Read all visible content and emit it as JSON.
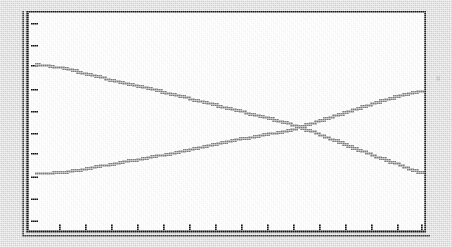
{
  "figure": {
    "kind": "scanned-line-chart",
    "background_color": "#d9d9d9",
    "plot_background_color": "#ffffff",
    "frame_color": "#111111",
    "series_color": "#808080",
    "title": "",
    "subtitle": "",
    "caption": ""
  },
  "chart_data": {
    "type": "line",
    "title": "",
    "xlabel": "",
    "ylabel": "",
    "grid": false,
    "legend": false,
    "legend_position": "none",
    "xlim": [
      0,
      14
    ],
    "ylim": [
      0,
      8
    ],
    "x_tick_labels": [
      "",
      "",
      "",
      "",
      "",
      "",
      "",
      "",
      "",
      "",
      "",
      "",
      "",
      "",
      ""
    ],
    "y_tick_labels": [
      "",
      "",
      "",
      "",
      "",
      "",
      "",
      "",
      ""
    ],
    "x_tick_count": 15,
    "y_tick_count": 9,
    "x": [
      0,
      1,
      2,
      3,
      4,
      5,
      6,
      7,
      8,
      9,
      10,
      11,
      12,
      13,
      14
    ],
    "series": [
      {
        "name": "descending-series",
        "color": "#808080",
        "values": [
          6.3,
          6.1,
          5.85,
          5.6,
          5.35,
          5.1,
          4.85,
          4.6,
          4.3,
          4.05,
          3.75,
          3.45,
          3.15,
          2.85,
          2.5
        ]
      },
      {
        "name": "ascending-series",
        "color": "#808080",
        "values": [
          2.55,
          2.7,
          2.9,
          3.1,
          3.3,
          3.5,
          3.7,
          3.9,
          4.15,
          4.4,
          4.65,
          4.9,
          5.15,
          5.4,
          5.6
        ]
      }
    ],
    "intersection": {
      "x": 8.05,
      "y": 4.2
    }
  },
  "geometry": {
    "frame": {
      "left": 26,
      "top": 11,
      "width": 400,
      "height": 222
    },
    "inner": {
      "left": 30,
      "top": 15,
      "right": 423,
      "bottom": 229
    },
    "series_pixels": {
      "descending": [
        [
          32,
          62
        ],
        [
          60,
          66
        ],
        [
          88,
          73
        ],
        [
          116,
          80
        ],
        [
          144,
          86
        ],
        [
          172,
          93
        ],
        [
          200,
          100
        ],
        [
          228,
          107
        ],
        [
          256,
          114
        ],
        [
          284,
          121
        ],
        [
          312,
          131
        ],
        [
          340,
          142
        ],
        [
          368,
          153
        ],
        [
          396,
          163
        ],
        [
          419,
          172
        ]
      ],
      "ascending": [
        [
          32,
          171
        ],
        [
          60,
          170
        ],
        [
          88,
          165
        ],
        [
          116,
          160
        ],
        [
          144,
          155
        ],
        [
          172,
          150
        ],
        [
          200,
          144
        ],
        [
          228,
          138
        ],
        [
          256,
          133
        ],
        [
          284,
          128
        ],
        [
          312,
          119
        ],
        [
          340,
          110
        ],
        [
          368,
          101
        ],
        [
          396,
          93
        ],
        [
          419,
          88
        ]
      ]
    },
    "x_tick_pixels": [
      57,
      83,
      109,
      135,
      161,
      187,
      213,
      239,
      265,
      291,
      317,
      343,
      369,
      395,
      419
    ],
    "y_tick_pixels": [
      22,
      44,
      64,
      88,
      110,
      132,
      152,
      175,
      197,
      219
    ]
  }
}
